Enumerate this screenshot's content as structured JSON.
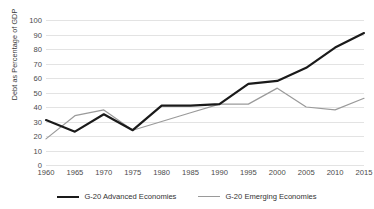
{
  "chart_data": {
    "type": "line",
    "title": "",
    "xlabel": "",
    "ylabel": "Debt as Percentage of GDP",
    "xlim": [
      1960,
      2015
    ],
    "ylim": [
      0,
      100
    ],
    "grid": true,
    "legend_position": "bottom",
    "x": [
      1960,
      1965,
      1970,
      1975,
      1980,
      1985,
      1990,
      1995,
      2000,
      2005,
      2010,
      2015
    ],
    "xtick_labels": [
      "1960",
      "1965",
      "1970",
      "1975",
      "1980",
      "1985",
      "1990",
      "1995",
      "2000",
      "2005",
      "2010",
      "2015"
    ],
    "ytick_labels": [
      "0",
      "10",
      "20",
      "30",
      "40",
      "50",
      "60",
      "70",
      "80",
      "90",
      "100"
    ],
    "ytick_values": [
      0,
      10,
      20,
      30,
      40,
      50,
      60,
      70,
      80,
      90,
      100
    ],
    "series": [
      {
        "name": "G-20 Advanced Economies",
        "color": "#1a1a1a",
        "width": 2.2,
        "values": [
          31,
          23,
          35,
          24,
          41,
          41,
          42,
          56,
          58,
          67,
          81,
          91
        ]
      },
      {
        "name": "G-20 Emerging Economies",
        "color": "#9a9a9a",
        "width": 1.2,
        "values": [
          18,
          34,
          38,
          24,
          30,
          36,
          42,
          42,
          53,
          40,
          38,
          46
        ]
      }
    ]
  },
  "legend": {
    "items": [
      {
        "label": "G-20 Advanced Economies"
      },
      {
        "label": "G-20 Emerging Economies"
      }
    ]
  }
}
